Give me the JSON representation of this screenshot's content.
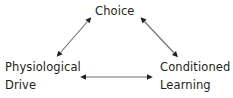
{
  "diagram": {
    "type": "triangle-relationship-diagram",
    "background_color": "#ffffff",
    "ink_color": "#231f20",
    "nodes": [
      {
        "id": "choice",
        "lines": [
          "Choice"
        ],
        "position": "top-center"
      },
      {
        "id": "physiological-drive",
        "lines": [
          "Physiological",
          "Drive"
        ],
        "position": "bottom-left"
      },
      {
        "id": "conditioned-learning",
        "lines": [
          "Conditioned",
          "Learning"
        ],
        "position": "bottom-right"
      }
    ],
    "connectors": [
      {
        "id": "physiological-drive-to-choice",
        "style": "double-headed-arrow",
        "orientation": "diagonal-up-right",
        "from": "physiological-drive",
        "to": "choice"
      },
      {
        "id": "choice-to-conditioned-learning",
        "style": "double-headed-arrow",
        "orientation": "diagonal-down-right",
        "from": "choice",
        "to": "conditioned-learning"
      },
      {
        "id": "physiological-drive-to-conditioned-learning",
        "style": "double-headed-arrow",
        "orientation": "horizontal",
        "from": "physiological-drive",
        "to": "conditioned-learning"
      }
    ]
  }
}
